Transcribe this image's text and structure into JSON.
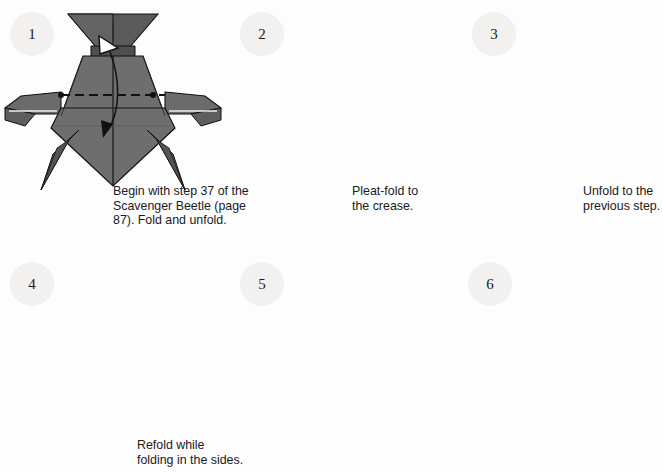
{
  "page": {
    "background_color": "#fdfdfd",
    "paper_fill": "#6e6e6e",
    "paper_shade_dark": "#585858",
    "paper_shade_darker": "#4e4e4e",
    "line_color": "#111111",
    "badge_color": "#f2f1ef",
    "badge_text_color": "#1b1b1b"
  },
  "steps": [
    {
      "number": "1",
      "badge_x": 10,
      "badge_y": 12,
      "caption": "Begin with step 37 of the\nScavenger Beetle (page\n87). Fold and unfold.",
      "caption_x": 113,
      "caption_y": 184,
      "marks": [
        "fold-unfold-arrow",
        "dashed-horizontal-crease",
        "crease-endpoint-dots"
      ]
    },
    {
      "number": "2",
      "badge_x": 240,
      "badge_y": 12,
      "caption": "Pleat-fold to\nthe crease.",
      "caption_x": 352,
      "caption_y": 184,
      "marks": [
        "dash-dot-line",
        "dashed-line",
        "pleat-arrow-down"
      ]
    },
    {
      "number": "3",
      "badge_x": 472,
      "badge_y": 12,
      "caption": "Unfold to the\nprevious step.",
      "caption_x": 583,
      "caption_y": 184,
      "marks": [
        "unfold-arrow-up"
      ]
    },
    {
      "number": "4",
      "badge_x": 10,
      "badge_y": 262,
      "caption": "Refold while\nfolding in the sides.",
      "caption_x": 137,
      "caption_y": 438,
      "marks": [
        "dash-dot-line",
        "dashed-line",
        "pleat-arrow-down",
        "side-rotate-arrow-left",
        "side-rotate-arrow-right"
      ]
    },
    {
      "number": "5",
      "badge_x": 240,
      "badge_y": 262,
      "caption": "",
      "caption_x": 0,
      "caption_y": 0,
      "marks": [
        "dash-dot-vertical",
        "wing-fold-arrow-left",
        "wing-fold-arrow-right",
        "side-rotate-arrow-left",
        "side-rotate-arrow-right"
      ]
    },
    {
      "number": "6",
      "badge_x": 468,
      "badge_y": 262,
      "caption": "",
      "caption_x": 0,
      "caption_y": 0,
      "marks": [
        "neck-rotate-arrow-left",
        "neck-rotate-arrow-right",
        "wing-tuck-arrow-left",
        "wing-tuck-arrow-right"
      ]
    }
  ]
}
